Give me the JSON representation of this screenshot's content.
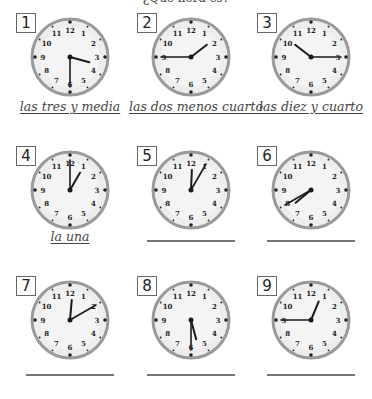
{
  "worksheet": {
    "top_text": "¿Qué hora es?",
    "colors": {
      "rim": "#9a9a9a",
      "face": "#ededed",
      "hand": "#1a1a1a",
      "label": "#444444",
      "line": "#777777"
    },
    "clocks": [
      {
        "number": "1",
        "hour": 3,
        "minute": 30,
        "answer": "las tres y media",
        "answered": true
      },
      {
        "number": "2",
        "hour": 1,
        "minute": 45,
        "answer": "las dos menos cuarto",
        "answered": true
      },
      {
        "number": "3",
        "hour": 10,
        "minute": 15,
        "answer": "las diez y cuarto",
        "answered": true
      },
      {
        "number": "4",
        "hour": 1,
        "minute": 0,
        "answer": "la una",
        "answered": true
      },
      {
        "number": "5",
        "hour": 12,
        "minute": 5,
        "answer": "",
        "answered": false
      },
      {
        "number": "6",
        "hour": 7,
        "minute": 40,
        "answer": "",
        "answered": false
      },
      {
        "number": "7",
        "hour": 12,
        "minute": 10,
        "answer": "",
        "answered": false
      },
      {
        "number": "8",
        "hour": 5,
        "minute": 30,
        "answer": "",
        "answered": false
      },
      {
        "number": "9",
        "hour": 12,
        "minute": 45,
        "answer": "",
        "answered": false
      }
    ],
    "dial_numbers": [
      "12",
      "1",
      "2",
      "3",
      "4",
      "5",
      "6",
      "7",
      "8",
      "9",
      "10",
      "11"
    ]
  }
}
